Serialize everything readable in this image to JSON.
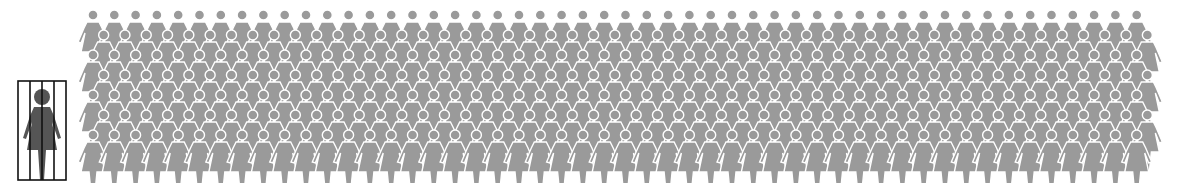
{
  "figure": {
    "jailed_figure": {
      "label": "woman-behind-bars",
      "count": 1,
      "color": "#555555",
      "bar_color": "#111111",
      "bars": 4
    },
    "crowd": {
      "label": "crowd-of-women",
      "color": "#9a9a9a",
      "outline_color": "#ffffff",
      "columns": 50,
      "rows": 7,
      "col_spacing": 21.3,
      "row_spacing": 20,
      "origin_x": 23,
      "origin_y": 22
    }
  }
}
